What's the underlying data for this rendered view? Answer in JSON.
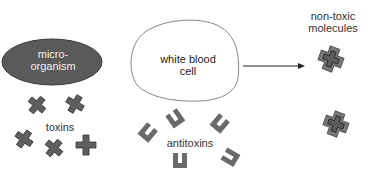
{
  "diagram": {
    "microorganism": {
      "label_line1": "micro-",
      "label_line2": "organism"
    },
    "toxins": {
      "label": "toxins",
      "count": 5
    },
    "white_blood_cell": {
      "label_line1": "white blood",
      "label_line2": "cell"
    },
    "antitoxins": {
      "label": "antitoxins",
      "count": 5
    },
    "non_toxic_molecules": {
      "label_line1": "non-toxic",
      "label_line2": "molecules",
      "count": 2
    },
    "colors": {
      "organism_fill": "#5a5a5a",
      "toxin_fill": "#5f5f5f",
      "antitoxin_fill": "#6a6a6a",
      "outline": "#888888"
    }
  }
}
